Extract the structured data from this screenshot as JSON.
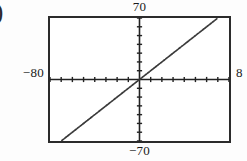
{
  "figure": {
    "marker_label": ")",
    "background_color": "#fdfdfd",
    "frame_color": "#2b2b2b",
    "plot_background": "#ffffff",
    "curve_color": "#3a3a3a"
  },
  "labels": {
    "top": "70",
    "bottom": "−70",
    "left": "−80",
    "right": "8"
  },
  "chart_data": {
    "type": "line",
    "title": "",
    "xlabel": "",
    "ylabel": "",
    "xlim": [
      -80,
      80
    ],
    "ylim": [
      -70,
      70
    ],
    "xticks_count": 16,
    "yticks_count": 14,
    "xtick_step": 10,
    "ytick_step": 10,
    "grid": false,
    "legend": null,
    "axes_style": "centered-crosshair-with-tick-marks",
    "series": [
      {
        "name": "line",
        "style": "dotted-line",
        "slope": 1,
        "intercept": 0,
        "x": [
          -65,
          -50,
          -35,
          -20,
          -5,
          0,
          10,
          25,
          40,
          55,
          68
        ],
        "y": [
          -65,
          -50,
          -35,
          -20,
          -5,
          0,
          10,
          25,
          40,
          55,
          68
        ]
      }
    ]
  }
}
